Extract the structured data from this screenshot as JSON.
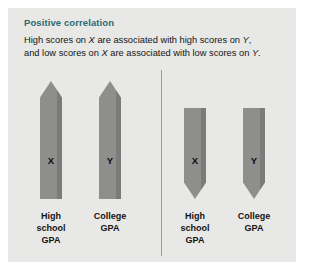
{
  "figure": {
    "title": "Positive correlation",
    "caption": {
      "line1_a": "High scores on ",
      "line1_x": "X",
      "line1_b": " are associated with high scores on ",
      "line1_y": "Y",
      "line1_c": ",",
      "line2_a": "and low scores on ",
      "line2_x": "X",
      "line2_b": " are associated with low scores on ",
      "line2_y": "Y",
      "line2_c": "."
    },
    "colors": {
      "card_background": "#e8e8e6",
      "title": "#2c6b73",
      "bar": "#8e8e8c",
      "divider": "#9a9a98",
      "text": "#141414"
    },
    "panels": [
      {
        "name": "positive-high",
        "direction": "up",
        "bars": [
          {
            "letter": "X",
            "caption": "High\nschool\nGPA",
            "direction": "up",
            "magnitude": "high"
          },
          {
            "letter": "Y",
            "caption": "College\nGPA",
            "direction": "up",
            "magnitude": "high"
          }
        ]
      },
      {
        "name": "positive-low",
        "direction": "down",
        "bars": [
          {
            "letter": "X",
            "caption": "High\nschool\nGPA",
            "direction": "down",
            "magnitude": "low"
          },
          {
            "letter": "Y",
            "caption": "College\nGPA",
            "direction": "down",
            "magnitude": "low"
          }
        ]
      }
    ]
  },
  "chart_data": {
    "type": "bar",
    "title": "Positive correlation",
    "subtitle": "High scores on X are associated with high scores on Y, and low scores on X are associated with low scores on Y.",
    "xlabel": "",
    "ylabel": "",
    "grid": false,
    "legend": "none",
    "groups": [
      {
        "name": "High scores",
        "direction": "up",
        "categories": [
          "High school GPA",
          "College GPA"
        ],
        "series_labels": [
          "X",
          "Y"
        ],
        "values": [
          1,
          1
        ]
      },
      {
        "name": "Low scores",
        "direction": "down",
        "categories": [
          "High school GPA",
          "College GPA"
        ],
        "series_labels": [
          "X",
          "Y"
        ],
        "values": [
          -1,
          -1
        ]
      }
    ]
  }
}
